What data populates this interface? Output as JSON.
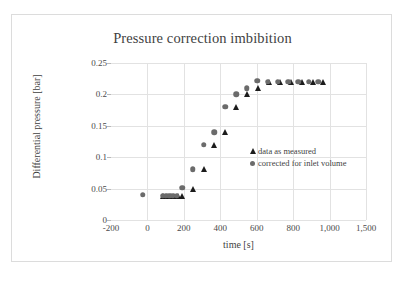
{
  "chart_data": {
    "type": "scatter",
    "title": "Pressure correction imbibition",
    "xlabel": "time [s]",
    "ylabel": "Differential pressure [bar]",
    "xlim": [
      -200,
      1200
    ],
    "ylim": [
      0,
      0.25
    ],
    "grid": true,
    "legend_position": "inside-center-right",
    "x_ticks": [
      {
        "value": -200,
        "label": "-200"
      },
      {
        "value": 0,
        "label": "0"
      },
      {
        "value": 200,
        "label": "200"
      },
      {
        "value": 400,
        "label": "400"
      },
      {
        "value": 600,
        "label": "600"
      },
      {
        "value": 800,
        "label": "800"
      },
      {
        "value": 1000,
        "label": "1,000"
      },
      {
        "value": 1200,
        "label": "1,500"
      }
    ],
    "y_ticks": [
      {
        "value": 0,
        "label": "0"
      },
      {
        "value": 0.05,
        "label": "0.05"
      },
      {
        "value": 0.1,
        "label": "0.1"
      },
      {
        "value": 0.15,
        "label": "0.15"
      },
      {
        "value": 0.2,
        "label": "0.2"
      },
      {
        "value": 0.25,
        "label": "0.25"
      }
    ],
    "series": [
      {
        "name": "data as measured",
        "marker": "triangle",
        "color": "#1c1c1c",
        "points": [
          {
            "x": 85,
            "y": 0.039
          },
          {
            "x": 108,
            "y": 0.039
          },
          {
            "x": 128,
            "y": 0.039
          },
          {
            "x": 148,
            "y": 0.039
          },
          {
            "x": 168,
            "y": 0.039
          },
          {
            "x": 188,
            "y": 0.039
          },
          {
            "x": 248,
            "y": 0.049
          },
          {
            "x": 308,
            "y": 0.081
          },
          {
            "x": 368,
            "y": 0.12
          },
          {
            "x": 428,
            "y": 0.14
          },
          {
            "x": 488,
            "y": 0.18
          },
          {
            "x": 548,
            "y": 0.2
          },
          {
            "x": 608,
            "y": 0.21
          },
          {
            "x": 668,
            "y": 0.219
          },
          {
            "x": 728,
            "y": 0.219
          },
          {
            "x": 788,
            "y": 0.219
          },
          {
            "x": 848,
            "y": 0.219
          },
          {
            "x": 908,
            "y": 0.219
          },
          {
            "x": 962,
            "y": 0.219
          }
        ]
      },
      {
        "name": "corrected for inlet volume",
        "marker": "circle",
        "color": "#6b6b6b",
        "points": [
          {
            "x": -25,
            "y": 0.04
          },
          {
            "x": 85,
            "y": 0.039
          },
          {
            "x": 100,
            "y": 0.039
          },
          {
            "x": 120,
            "y": 0.039
          },
          {
            "x": 140,
            "y": 0.039
          },
          {
            "x": 160,
            "y": 0.039
          },
          {
            "x": 190,
            "y": 0.051
          },
          {
            "x": 248,
            "y": 0.081
          },
          {
            "x": 308,
            "y": 0.12
          },
          {
            "x": 368,
            "y": 0.14
          },
          {
            "x": 428,
            "y": 0.18
          },
          {
            "x": 488,
            "y": 0.2
          },
          {
            "x": 545,
            "y": 0.21
          },
          {
            "x": 602,
            "y": 0.222
          },
          {
            "x": 660,
            "y": 0.22
          },
          {
            "x": 715,
            "y": 0.22
          },
          {
            "x": 772,
            "y": 0.22
          },
          {
            "x": 828,
            "y": 0.22
          },
          {
            "x": 885,
            "y": 0.22
          },
          {
            "x": 938,
            "y": 0.22
          }
        ]
      }
    ]
  }
}
